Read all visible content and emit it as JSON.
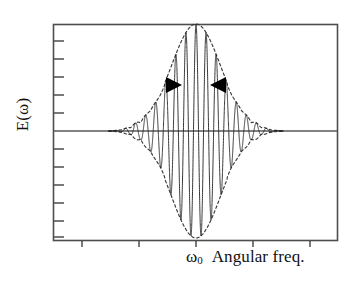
{
  "figure": {
    "type": "scientific-plot",
    "y_axis": {
      "label": "E(ω)",
      "tick_count": 11,
      "ticks_side": "inner-left"
    },
    "x_axis": {
      "center_label": "ω",
      "center_label_sub": "0",
      "title": "Angular freq.",
      "tick_count": 5
    },
    "annotations": {
      "bandwidth_marker_left": "▶",
      "bandwidth_marker_right": "◀"
    },
    "colors": {
      "frame": "#4d4d4d",
      "baseline": "#585858",
      "carrier": "#2b2b2b",
      "envelope": "#3a3a3a",
      "arrow": "#000000",
      "background": "#ffffff"
    }
  },
  "chart_data": {
    "type": "line",
    "title": "",
    "xlabel": "Angular freq.",
    "ylabel": "E(ω)",
    "xlim": [
      -1,
      1
    ],
    "ylim": [
      -1.08,
      1.08
    ],
    "grid": false,
    "legend": null,
    "x_tick_values": [
      -0.8,
      -0.4,
      0.0,
      0.4,
      0.8
    ],
    "x_tick_labels": [
      "",
      "",
      "ω₀",
      "",
      ""
    ],
    "y_tick_count": 11,
    "series": [
      {
        "name": "carrier",
        "description": "Oscillating field E(ω) = A(ω) · cos(2π f (ω-ω₀))",
        "form": "gaussian-modulated-cosine",
        "carrier_cycles_visible": 14,
        "x": [
          -0.5,
          -0.45,
          -0.4,
          -0.35,
          -0.3,
          -0.25,
          -0.2,
          -0.15,
          -0.1,
          -0.05,
          0.0,
          0.05,
          0.1,
          0.15,
          0.2,
          0.25,
          0.3,
          0.35,
          0.4,
          0.45,
          0.5
        ],
        "envelope_values": [
          0.02,
          0.04,
          0.08,
          0.14,
          0.25,
          0.41,
          0.6,
          0.78,
          0.92,
          0.99,
          1.0,
          0.99,
          0.92,
          0.78,
          0.6,
          0.41,
          0.25,
          0.14,
          0.08,
          0.04,
          0.02
        ]
      },
      {
        "name": "envelope-upper",
        "description": "Positive Gaussian envelope (dashed)",
        "style": "dashed",
        "peak_value": 1.0,
        "center": 0.0,
        "sigma": 0.175
      },
      {
        "name": "envelope-lower",
        "description": "Negative Gaussian envelope (dashed)",
        "style": "dashed",
        "peak_value": -1.0,
        "center": 0.0,
        "sigma": 0.175
      }
    ],
    "annotations": [
      {
        "name": "bandwidth-arrows",
        "type": "inward-arrow-pair",
        "y_value": 0.62,
        "x_left": -0.135,
        "x_right": 0.135,
        "meaning": "spectral bandwidth marker"
      }
    ]
  }
}
